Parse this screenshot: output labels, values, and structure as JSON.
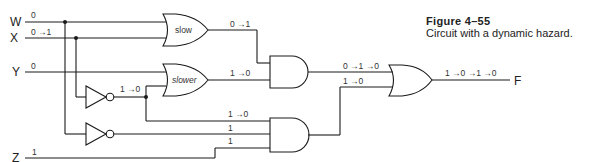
{
  "caption": {
    "figure": "Figure  4–55",
    "description": "Circuit with a dynamic hazard."
  },
  "inputs": [
    {
      "name": "W",
      "value": "0"
    },
    {
      "name": "X",
      "value": "0 →1"
    },
    {
      "name": "Y",
      "value": "0"
    },
    {
      "name": "Z",
      "value": "1"
    }
  ],
  "output": {
    "name": "F",
    "value": "1 →0 →1 →0"
  },
  "gates": {
    "or_slow": {
      "label": "slow",
      "output": "0 →1"
    },
    "or_slower": {
      "label": "slower",
      "output": "1 →0"
    },
    "not_x": {
      "output": "1 →0"
    },
    "and_top": {
      "output": "0 →1 →0"
    },
    "and_bottom": {
      "inputs": [
        "1 →0",
        "1",
        "1"
      ],
      "output": "1 →0"
    },
    "or_final": {
      "output": "1 →0 →1 →0"
    }
  },
  "colors": {
    "line": "#1a1a1a",
    "text": "#222222"
  }
}
